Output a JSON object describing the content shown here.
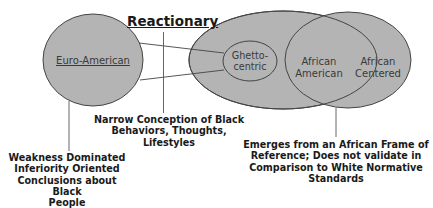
{
  "diagram": {
    "title": "Reactionary",
    "nodes": {
      "euro_american": "Euro-American",
      "ghetto_centric_line1": "Ghetto-",
      "ghetto_centric_line2": "centric",
      "african_american_line1": "African",
      "african_american_line2": "American",
      "african_centered_line1": "African",
      "african_centered_line2": "Centered"
    },
    "captions": {
      "narrow": {
        "line1": "Narrow Conception of Black",
        "line2": "Behaviors, Thoughts,",
        "line3": "Lifestyles"
      },
      "weakness": {
        "line1": "Weakness Dominated",
        "line2": "Inferiority Oriented",
        "line3": "Conclusions about Black",
        "line4": "People"
      },
      "emerges": {
        "line1": "Emerges from an African Frame of",
        "line2": "Reference; Does not validate in",
        "line3": "Comparison to White Normative",
        "line4": "Standards"
      }
    },
    "colors": {
      "ellipse_fill": "#b4b4b4",
      "stroke": "#3a3a3a",
      "background": "#ffffff"
    }
  }
}
